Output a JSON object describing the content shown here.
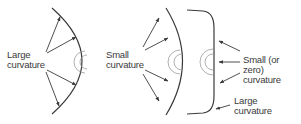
{
  "panels": [
    {
      "id": "panel-1",
      "label_lines": [
        "Large",
        "curvature"
      ]
    },
    {
      "id": "panel-2",
      "label_lines": [
        "Small",
        "curvature"
      ]
    },
    {
      "id": "panel-3",
      "labels": [
        {
          "lines": [
            "Small (or zero)",
            "curvature"
          ]
        },
        {
          "lines": [
            "Large",
            "curvature"
          ]
        }
      ]
    }
  ],
  "colors": {
    "line": "#3a3a3a",
    "ripple": "#9a9a9a",
    "text": "#3a3a3a",
    "background": "#ffffff"
  }
}
